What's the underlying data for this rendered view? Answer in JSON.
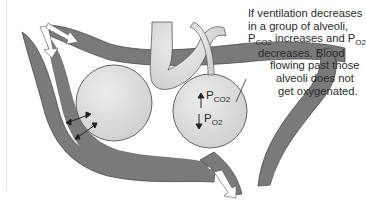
{
  "diagram": {
    "caption_lines": [
      {
        "text": "If ventilation decreases",
        "indent": 0
      },
      {
        "text": "in a group of alveoli,",
        "indent": 0
      },
      {
        "pre": "P",
        "sub1": "CO2",
        "mid": " increases and P",
        "sub2": "O2",
        "indent": 0
      },
      {
        "text": "decreases. Blood",
        "indent": 10
      },
      {
        "text": "flowing past those",
        "indent": 22
      },
      {
        "text": "alveoli does not",
        "indent": 28
      },
      {
        "text": "get oxygenated.",
        "indent": 30
      }
    ],
    "right_alveolus_labels": {
      "pco2": {
        "arrow": "up",
        "main": "P",
        "sub": "CO2"
      },
      "po2": {
        "arrow": "down",
        "main": "P",
        "sub": "O2"
      }
    },
    "components": [
      "blood-vessel",
      "left-alveolus",
      "right-alveolus",
      "airway",
      "blood-flow-arrow-in-1",
      "blood-flow-arrow-in-2",
      "blood-flow-arrow-out",
      "gas-exchange-arrows"
    ],
    "colors": {
      "vessel": "#7a7a7a",
      "vessel_edge": "#4a4a4a",
      "alveolus": "#dcdcdc",
      "alveolus_edge": "#555555",
      "arrow_fill": "#ffffff",
      "text": "#2a2a2a"
    }
  }
}
